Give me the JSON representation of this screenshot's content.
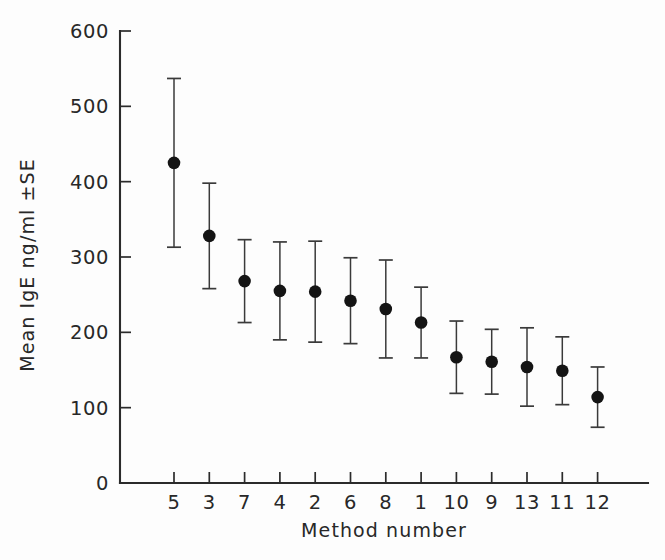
{
  "chart_data": {
    "type": "scatter",
    "title": "",
    "xlabel": "Method number",
    "ylabel": "Mean IgE ng/ml ±SE",
    "categories": [
      "5",
      "3",
      "7",
      "4",
      "2",
      "6",
      "8",
      "1",
      "10",
      "9",
      "13",
      "11",
      "12"
    ],
    "values": [
      425,
      328,
      268,
      255,
      254,
      242,
      231,
      213,
      167,
      161,
      154,
      149,
      114
    ],
    "errors": [
      112,
      70,
      55,
      65,
      67,
      57,
      65,
      47,
      48,
      43,
      52,
      45,
      40
    ],
    "ylim": [
      0,
      600
    ],
    "yticks": [
      0,
      100,
      200,
      300,
      400,
      500,
      600
    ],
    "ytick_labels": [
      "0",
      "100",
      "200",
      "300",
      "400",
      "500",
      "600"
    ],
    "grid": false,
    "legend": null,
    "marker": "filled-circle",
    "error_style": "capped-vertical-bars",
    "series": [
      {
        "name": "Mean IgE",
        "points": [
          {
            "category": "5",
            "value": 425,
            "error": 112,
            "low": 313,
            "high": 537
          },
          {
            "category": "3",
            "value": 328,
            "error": 70,
            "low": 258,
            "high": 398
          },
          {
            "category": "7",
            "value": 268,
            "error": 55,
            "low": 213,
            "high": 323
          },
          {
            "category": "4",
            "value": 255,
            "error": 65,
            "low": 190,
            "high": 320
          },
          {
            "category": "2",
            "value": 254,
            "error": 67,
            "low": 187,
            "high": 321
          },
          {
            "category": "6",
            "value": 242,
            "error": 57,
            "low": 185,
            "high": 299
          },
          {
            "category": "8",
            "value": 231,
            "error": 65,
            "low": 166,
            "high": 296
          },
          {
            "category": "1",
            "value": 213,
            "error": 47,
            "low": 166,
            "high": 260
          },
          {
            "category": "10",
            "value": 167,
            "error": 48,
            "low": 119,
            "high": 215
          },
          {
            "category": "9",
            "value": 161,
            "error": 43,
            "low": 118,
            "high": 204
          },
          {
            "category": "13",
            "value": 154,
            "error": 52,
            "low": 102,
            "high": 206
          },
          {
            "category": "11",
            "value": 149,
            "error": 45,
            "low": 104,
            "high": 194
          },
          {
            "category": "12",
            "value": 114,
            "error": 40,
            "low": 74,
            "high": 154
          }
        ]
      }
    ],
    "colors": {
      "marker": "#141414",
      "error_bar": "#3a3a3a",
      "axis": "#2b2b2b",
      "text": "#282828",
      "background": "#fdfdfd"
    }
  }
}
